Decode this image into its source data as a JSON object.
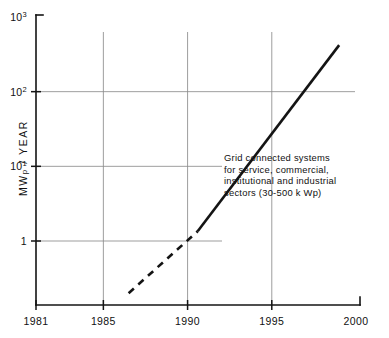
{
  "chart_data": {
    "type": "line",
    "title": "",
    "subtitle": "",
    "xlabel": "",
    "ylabel": "MWp / YEAR",
    "ylabel_main": "MW",
    "ylabel_sub": "p",
    "ylabel_tail": " / YEAR",
    "xscale": "linear",
    "yscale": "log",
    "xlim": [
      1981,
      2000
    ],
    "ylim": [
      1,
      1000
    ],
    "grid": "both",
    "legend": "none",
    "x_ticks": [
      {
        "value": 1981,
        "label": "1981"
      },
      {
        "value": 1985,
        "label": "1985"
      },
      {
        "value": 1990,
        "label": "1990"
      },
      {
        "value": 1995,
        "label": "1995"
      },
      {
        "value": 2000,
        "label": "2000"
      }
    ],
    "y_ticks": [
      {
        "value": 1,
        "label": "1",
        "mantissa": "1",
        "exponent": ""
      },
      {
        "value": 10,
        "label": "10^1",
        "mantissa": "10",
        "exponent": "1"
      },
      {
        "value": 100,
        "label": "10^2",
        "mantissa": "10",
        "exponent": "2"
      },
      {
        "value": 1000,
        "label": "10^3",
        "mantissa": "10",
        "exponent": "3"
      }
    ],
    "gridlines_x": [
      1985,
      1990,
      1995
    ],
    "gridlines_y": [
      1,
      10,
      100
    ],
    "series": [
      {
        "name": "Grid connected PV projection (projected)",
        "style": "dashed",
        "points": [
          {
            "x": 1986.5,
            "y": 0.2
          },
          {
            "x": 1990.6,
            "y": 1.35
          }
        ]
      },
      {
        "name": "Grid connected PV projection (forecast)",
        "style": "solid",
        "points": [
          {
            "x": 1990.6,
            "y": 1.35
          },
          {
            "x": 1999.0,
            "y": 420
          }
        ]
      }
    ],
    "annotations": [
      {
        "name": "grid-connected-systems-note",
        "lines": [
          "Grid connected systems",
          "for service, commercial,",
          "institutional and industrial",
          "sectors (30-500 k Wp)"
        ]
      }
    ],
    "colors": {
      "line": "#141414",
      "axis": "#141414",
      "grid": "#8c8c8c",
      "background": "#ffffff"
    }
  }
}
